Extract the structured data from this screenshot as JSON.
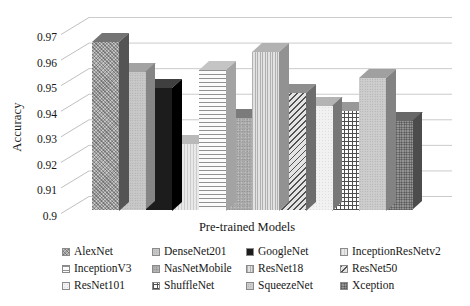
{
  "chart_data": {
    "type": "bar",
    "title": "",
    "xlabel": "Pre-trained Models",
    "ylabel": "Accuracy",
    "ylim": [
      0.9,
      0.97
    ],
    "yticks": [
      "0.9",
      "0.91",
      "0.92",
      "0.93",
      "0.94",
      "0.95",
      "0.96",
      "0.97"
    ],
    "grid": "horizontal",
    "effect": "3d-column",
    "legend_position": "bottom",
    "categories": [
      "AlexNet",
      "DenseNet201",
      "GoogleNet",
      "InceptionResNetv2",
      "InceptionV3",
      "NasNetMobile",
      "ResNet18",
      "ResNet50",
      "ResNet101",
      "ShuffleNet",
      "SqueezeNet",
      "Xception"
    ],
    "values": [
      0.966,
      0.954,
      0.948,
      0.926,
      0.955,
      0.936,
      0.962,
      0.946,
      0.941,
      0.939,
      0.952,
      0.935
    ],
    "patterns": [
      "diagonal-weave",
      "light-speckle",
      "solid-black",
      "faint-vertical-dots",
      "horizontal-lines",
      "mid-speckle",
      "vertical-dots",
      "diagonal-stripes",
      "plain-light",
      "square-grid",
      "speckle",
      "dark-check"
    ]
  },
  "colors": {
    "gridline": "#cbcbcb",
    "leader_tick": "#c0c0c0",
    "axis_text": "#161616",
    "background": "#ffffff"
  }
}
